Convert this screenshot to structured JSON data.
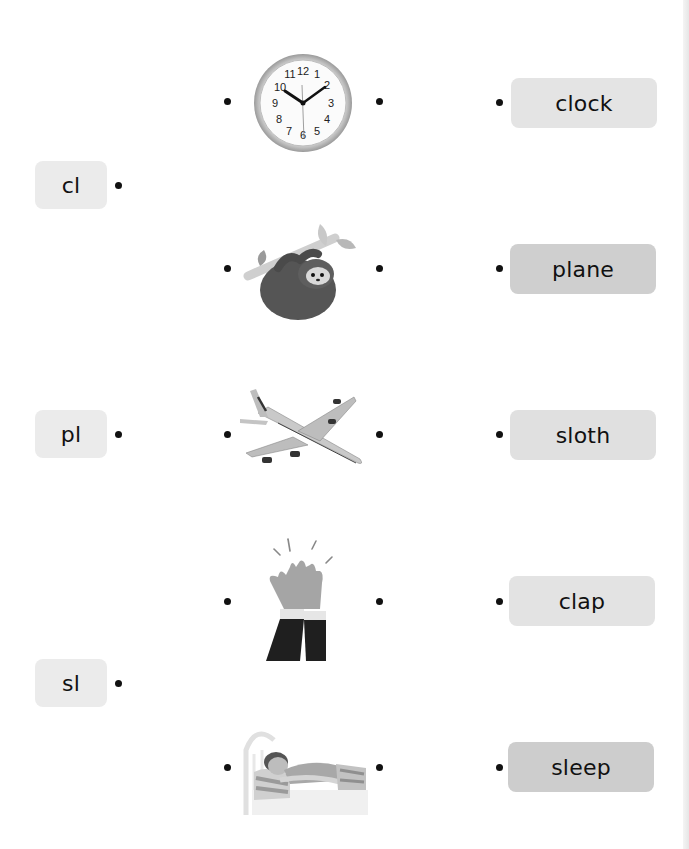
{
  "worksheet": {
    "left_blends": [
      {
        "label": "cl"
      },
      {
        "label": "pl"
      },
      {
        "label": "sl"
      }
    ],
    "pictures": [
      {
        "name": "clock-picture"
      },
      {
        "name": "sloth-picture"
      },
      {
        "name": "plane-picture"
      },
      {
        "name": "clap-picture"
      },
      {
        "name": "sleep-picture"
      }
    ],
    "words": [
      {
        "label": "clock",
        "color": "#e4e4e4"
      },
      {
        "label": "plane",
        "color": "#cfcfcf"
      },
      {
        "label": "sloth",
        "color": "#e0e0e0"
      },
      {
        "label": "clap",
        "color": "#e3e3e3"
      },
      {
        "label": "sleep",
        "color": "#cdcdcd"
      }
    ],
    "clock_numbers": [
      "12",
      "1",
      "2",
      "3",
      "4",
      "5",
      "6",
      "7",
      "8",
      "9",
      "10",
      "11"
    ]
  }
}
